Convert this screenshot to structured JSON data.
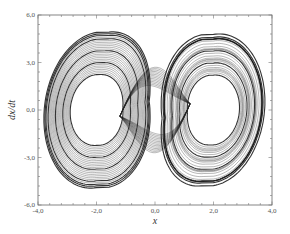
{
  "chart_data": {
    "type": "line",
    "title": "",
    "xlabel": "x",
    "ylabel": "dx/dt",
    "xlim": [
      -4.0,
      4.0
    ],
    "ylim": [
      -6.0,
      6.0
    ],
    "x_ticks": [
      "-4,0",
      "-2,0",
      "0,0",
      "2,0",
      "4,0"
    ],
    "y_ticks": [
      "6,0",
      "3,0",
      "0,0",
      "-3,0",
      "-6,0"
    ],
    "grid": false,
    "legend": null,
    "series": [
      {
        "name": "trajectory",
        "style": "dense overlapping closed orbits",
        "left_lobe": {
          "center_x": -2.0,
          "center_y": 0.0,
          "x_range": [
            -3.5,
            -0.3
          ],
          "y_range": [
            -5.0,
            5.0
          ]
        },
        "right_lobe": {
          "center_x": 2.0,
          "center_y": 0.0,
          "x_range": [
            0.3,
            3.5
          ],
          "y_range": [
            -5.0,
            5.0
          ]
        },
        "outer_envelope_points": [
          {
            "x": -3.2,
            "y": 4.2
          },
          {
            "x": -2.0,
            "y": 5.0
          },
          {
            "x": -1.0,
            "y": 3.5
          },
          {
            "x": 0.0,
            "y": 0.8
          },
          {
            "x": 1.0,
            "y": 3.8
          },
          {
            "x": 2.0,
            "y": 5.3
          },
          {
            "x": 3.3,
            "y": 3.5
          },
          {
            "x": 3.5,
            "y": 0.0
          },
          {
            "x": 3.0,
            "y": -3.8
          },
          {
            "x": 2.0,
            "y": -5.0
          },
          {
            "x": 1.0,
            "y": -3.5
          },
          {
            "x": 0.0,
            "y": -0.8
          },
          {
            "x": -1.0,
            "y": -3.8
          },
          {
            "x": -2.0,
            "y": -5.3
          },
          {
            "x": -3.3,
            "y": -3.5
          },
          {
            "x": -3.5,
            "y": 0.0
          }
        ],
        "inner_holes": [
          {
            "x": -1.6,
            "y": 0.2
          },
          {
            "x": 1.6,
            "y": -0.2
          }
        ]
      }
    ]
  }
}
